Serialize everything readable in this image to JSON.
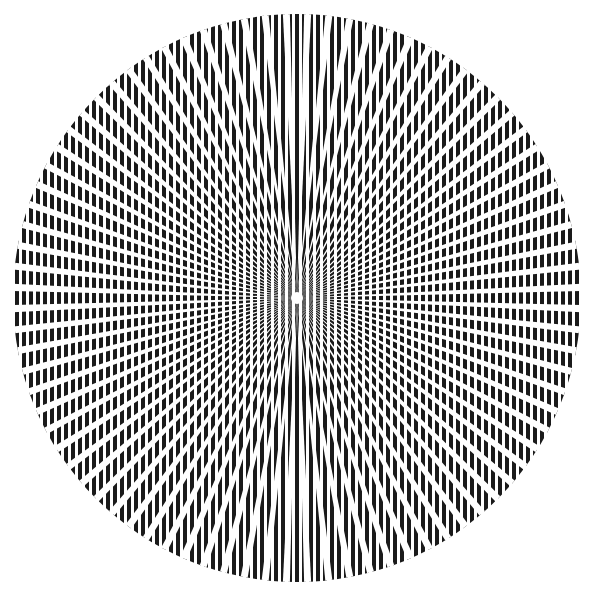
{
  "figure": {
    "title": "Radial moire optical illusion",
    "background": "#ffffff",
    "ink": "#1a1a1a",
    "circle": {
      "cx": 297,
      "cy": 298,
      "r": 284
    },
    "stripes": {
      "period": 7,
      "width": 4,
      "orientation": "vertical"
    },
    "spokes": {
      "count": 84,
      "gap_at_edge": 7
    },
    "center_dot": {
      "r": 6,
      "color": "#ffffff"
    }
  }
}
